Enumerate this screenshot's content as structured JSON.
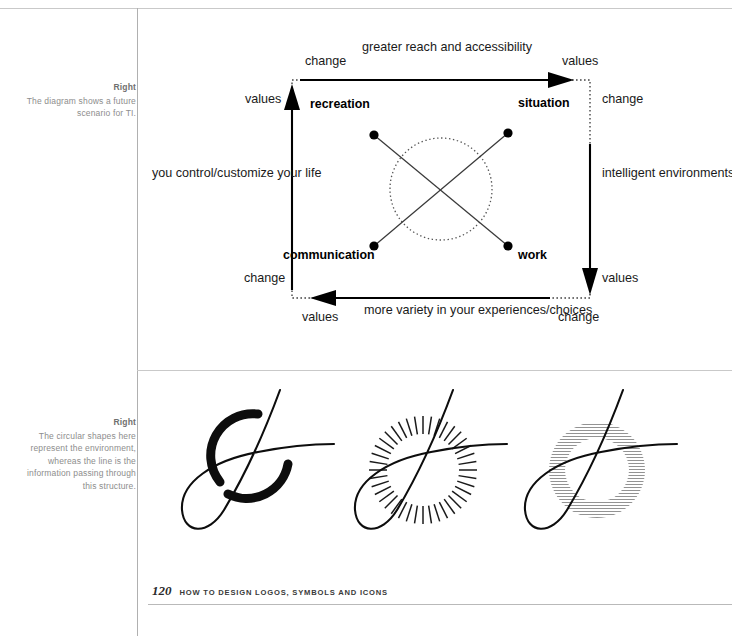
{
  "page": {
    "folio": "120",
    "running_head": "HOW TO DESIGN LOGOS, SYMBOLS AND ICONS"
  },
  "captions": [
    {
      "heading": "Right",
      "body": "The diagram shows a future scenario for TI."
    },
    {
      "heading": "Right",
      "body": "The circular shapes here represent the environment, whereas the line is the information passing through this structure."
    }
  ],
  "diagram": {
    "axis_labels": {
      "top_left_outer": "change",
      "top_left_inner": "values",
      "top_center": "greater reach and accessibility",
      "top_right_outer": "values",
      "top_right_inner": "change",
      "left_middle": "you control/customize your life",
      "right_middle": "intelligent environments",
      "bottom_left_outer": "change",
      "bottom_left_inner": "values",
      "bottom_center": "more variety in your experiences/choices",
      "bottom_right_outer": "values",
      "bottom_right_inner": "change"
    },
    "nodes": [
      {
        "id": "recreation",
        "label": "recreation"
      },
      {
        "id": "situation",
        "label": "situation"
      },
      {
        "id": "communication",
        "label": "communication"
      },
      {
        "id": "work",
        "label": "work"
      }
    ],
    "colors": {
      "stroke": "#000000",
      "dotted": "#555555"
    }
  },
  "marks": [
    {
      "id": "mark-solid-arc",
      "name": "solid-broken-circle-mark"
    },
    {
      "id": "mark-radial-ticks",
      "name": "radial-tick-circle-mark"
    },
    {
      "id": "mark-hatched-ring",
      "name": "hatched-ring-circle-mark"
    }
  ]
}
